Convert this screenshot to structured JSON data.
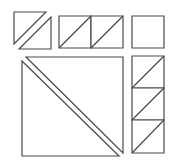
{
  "diagram": {
    "stroke_color": "#4a4a4a",
    "background": "#ffffff",
    "shapes": [
      {
        "id": "top-left-upper-triangle",
        "points": "14,12 46,12 14,44"
      },
      {
        "id": "top-left-lower-triangle",
        "points": "51,17 51,49 19,49"
      },
      {
        "id": "top-middle-cell-1",
        "points": "59,16 91,16 91,48 59,48"
      },
      {
        "id": "top-middle-cell-1-diagonal",
        "points": "59,48 91,16"
      },
      {
        "id": "top-middle-cell-2",
        "points": "91,16 123,16 123,48 91,48"
      },
      {
        "id": "top-middle-cell-2-diagonal",
        "points": "91,48 123,16"
      },
      {
        "id": "top-right-square",
        "points": "132,16 164,16 164,48 132,48"
      },
      {
        "id": "big-upper-right-triangle",
        "points": "26,57 123,57 123,153"
      },
      {
        "id": "big-lower-left-triangle",
        "points": "22,61 119,156 22,156"
      },
      {
        "id": "right-column-cell-1",
        "points": "132,56 164,56 164,88 132,88"
      },
      {
        "id": "right-column-cell-1-diagonal",
        "points": "132,88 164,56"
      },
      {
        "id": "right-column-cell-2",
        "points": "132,88 164,88 164,120 132,120"
      },
      {
        "id": "right-column-cell-2-diagonal",
        "points": "132,120 164,88"
      },
      {
        "id": "right-column-cell-3",
        "points": "132,120 164,120 164,153 132,153"
      },
      {
        "id": "right-column-cell-3-diagonal",
        "points": "132,153 164,120"
      }
    ]
  }
}
